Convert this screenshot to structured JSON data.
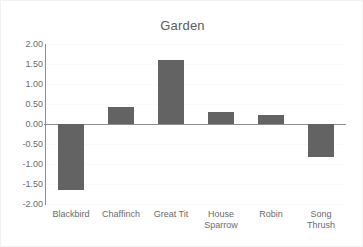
{
  "chart_data": {
    "type": "bar",
    "title": "Garden",
    "xlabel": "",
    "ylabel": "",
    "categories": [
      "Blackbird",
      "Chaffinch",
      "Great Tit",
      "House Sparrow",
      "Robin",
      "Song Thrush"
    ],
    "category_lines": [
      [
        "Blackbird"
      ],
      [
        "Chaffinch"
      ],
      [
        "Great Tit"
      ],
      [
        "House",
        "Sparrow"
      ],
      [
        "Robin"
      ],
      [
        "Song Thrush"
      ]
    ],
    "values": [
      -1.65,
      0.43,
      1.6,
      0.3,
      0.22,
      -0.83
    ],
    "ylim": [
      -2.0,
      2.0
    ],
    "ytick_values": [
      2.0,
      1.5,
      1.0,
      0.5,
      0.0,
      -0.5,
      -1.0,
      -1.5,
      -2.0
    ],
    "ytick_labels": [
      "2.00",
      "1.50",
      "1.00",
      "0.50",
      "0.00",
      "-0.50",
      "-1.00",
      "-1.50",
      "-2.00"
    ],
    "grid": true,
    "legend": false,
    "legend_position": "none",
    "bar_color": "#636363",
    "axis_color": "#8d8d8d",
    "grid_color": "#fafafa",
    "text_color": "#6b6b6b",
    "title_color": "#5a5a5a",
    "background_color": "#ffffff"
  }
}
